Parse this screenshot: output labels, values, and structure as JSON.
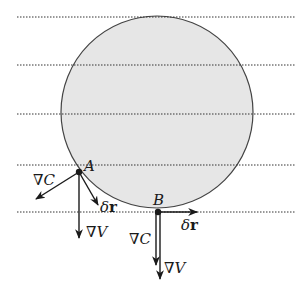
{
  "diagram": {
    "colors": {
      "circle_fill": "#e6e6e6",
      "circle_stroke": "#444444",
      "ink": "#1a1a1a",
      "level_line": "#333333"
    },
    "level_lines_count": 5,
    "points": {
      "A": {
        "label": "A",
        "vectors": {
          "gradC": {
            "label": "∇C"
          },
          "deltaR": {
            "label_prefix": "δ",
            "label_bold": "r"
          },
          "gradV": {
            "label": "∇V"
          }
        }
      },
      "B": {
        "label": "B",
        "vectors": {
          "gradC": {
            "label": "∇C"
          },
          "deltaR": {
            "label_prefix": "δ",
            "label_bold": "r"
          },
          "gradV": {
            "label": "∇V"
          }
        }
      }
    }
  }
}
